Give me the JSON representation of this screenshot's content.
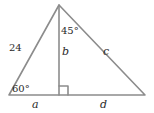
{
  "diagram": {
    "type": "triangle-with-altitude",
    "vertices": {
      "apex": {
        "x": 59,
        "y": 5
      },
      "bottom_left": {
        "x": 9,
        "y": 95
      },
      "bottom_right": {
        "x": 145,
        "y": 95
      },
      "altitude_foot": {
        "x": 59,
        "y": 95
      }
    },
    "labels": {
      "left_side": "24",
      "altitude": "b",
      "right_side": "c",
      "base_left": "a",
      "base_right": "d",
      "angle_bottom_left": "60°",
      "angle_apex_right": "45°"
    },
    "colors": {
      "line": "#8c8c8c",
      "text": "#2a2a2a",
      "background": "#ffffff"
    }
  }
}
